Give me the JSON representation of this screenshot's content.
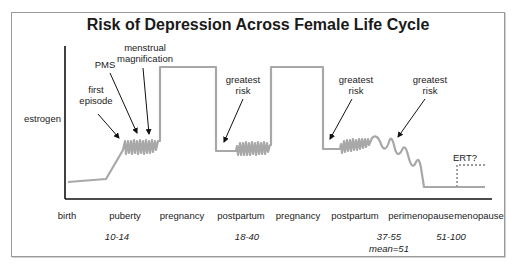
{
  "title": "Risk of Depression Across Female Life Cycle",
  "y_axis_label": "estrogen",
  "annotations": {
    "first_episode": [
      "first",
      "episode"
    ],
    "pms": "PMS",
    "menstrual_magnification": [
      "menstrual",
      "magnification"
    ],
    "greatest_risk_1": [
      "greatest",
      "risk"
    ],
    "greatest_risk_2": [
      "greatest",
      "risk"
    ],
    "greatest_risk_3": [
      "greatest",
      "risk"
    ],
    "ert": "ERT?"
  },
  "stages": [
    "birth",
    "puberty",
    "pregnancy",
    "postpartum",
    "pregnancy",
    "postpartum",
    "perimenopause",
    "menopause"
  ],
  "ages": {
    "puberty": "10-14",
    "reproductive": "18-40",
    "perimenopause": "37-55",
    "perimenopause_mean": "mean=51",
    "menopause": "51-100"
  },
  "colors": {
    "curve": "#a8a8a8",
    "axis": "#111111",
    "arrow": "#111111",
    "ert_dash": "#9a9a9a",
    "frame": "#9a9a9a"
  }
}
